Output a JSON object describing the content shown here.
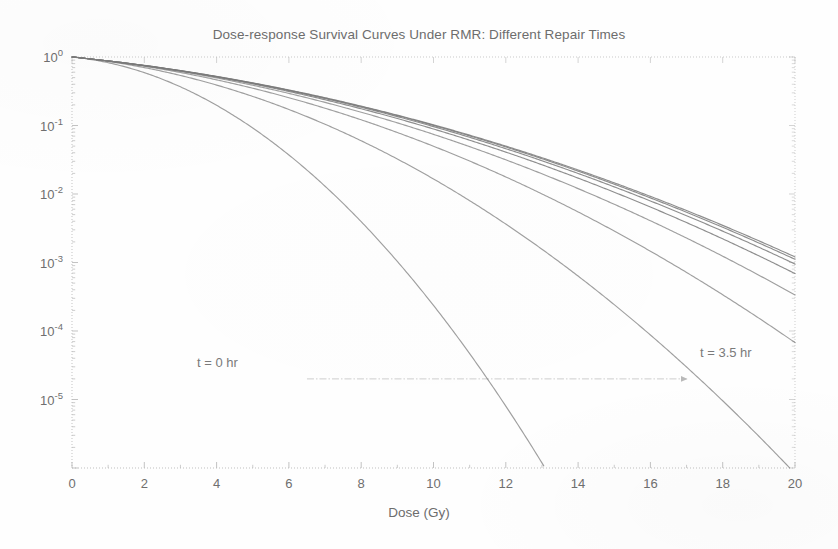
{
  "figure": {
    "title": "Dose-response Survival Curves Under RMR: Different Repair Times",
    "background_color": "#fefefe",
    "axis_color": "#b9b9b9",
    "curve_color": "#7a7a7a",
    "text_color": "#6d6d6d"
  },
  "annotations": {
    "left_label": "t = 0 hr",
    "right_label": "t = 3.5 hr",
    "arrow_icon": "arrow-right-icon"
  },
  "chart_data": {
    "type": "line",
    "title": "Dose-response Survival Curves Under RMR: Different Repair Times",
    "xlabel": "Dose (Gy)",
    "ylabel": "",
    "yscale": "log",
    "xscale": "linear",
    "xlim": [
      0,
      20
    ],
    "ylim": [
      1e-06,
      1
    ],
    "xticks": [
      0,
      2,
      4,
      6,
      8,
      10,
      12,
      14,
      16,
      18,
      20
    ],
    "xticklabels": [
      "0",
      "2",
      "4",
      "6",
      "8",
      "10",
      "12",
      "14",
      "16",
      "18",
      "20"
    ],
    "yticks": [
      1,
      0.1,
      0.01,
      0.001,
      0.0001,
      1e-05
    ],
    "yticklabels": [
      "10^0",
      "10^-1",
      "10^-2",
      "10^-3",
      "10^-4",
      "10^-5"
    ],
    "grid": false,
    "minor_ticks": true,
    "legend": "none",
    "annotations": [
      {
        "text": "t = 0 hr",
        "x": 5.0,
        "y": 3e-05
      },
      {
        "text": "t = 3.5 hr",
        "x": 17.2,
        "y": 5.5e-05
      },
      {
        "text": "arrow",
        "from_x": 6.5,
        "to_x": 17.2,
        "y": 2e-05
      }
    ],
    "model": "linear-quadratic with repair: log10(S) = -(alpha*D + beta_eff*D^2)/ln(10)",
    "series": [
      {
        "name": "t = 0 hr",
        "repair_time_hr": 0.0,
        "alpha": 0.12,
        "beta": 0.0715,
        "x_at_axis_exit": 8.7
      },
      {
        "name": "t = 0.5 hr",
        "repair_time_hr": 0.5,
        "alpha": 0.12,
        "beta": 0.029,
        "x_at_axis_exit": 13.4
      },
      {
        "name": "t = 1.0 hr",
        "repair_time_hr": 1.0,
        "alpha": 0.12,
        "beta": 0.018,
        "x_at_axis_exit": 16.9
      },
      {
        "name": "t = 1.5 hr",
        "repair_time_hr": 1.5,
        "alpha": 0.12,
        "beta": 0.014,
        "x_at_axis_exit": 18.8
      },
      {
        "name": "t = 2.0 hr",
        "repair_time_hr": 2.0,
        "alpha": 0.12,
        "beta": 0.0122,
        "x_at_axis_exit": 19.9
      },
      {
        "name": "t = 2.5 hr",
        "repair_time_hr": 2.5,
        "alpha": 0.12,
        "beta": 0.0114,
        "x_at_axis_exit": 20.0
      },
      {
        "name": "t = 3.0 hr",
        "repair_time_hr": 3.0,
        "alpha": 0.12,
        "beta": 0.011,
        "x_at_axis_exit": 20.0
      },
      {
        "name": "t = 3.5 hr",
        "repair_time_hr": 3.5,
        "alpha": 0.12,
        "beta": 0.0108,
        "x_at_axis_exit": 20.0
      }
    ],
    "sample_points": {
      "x": [
        0,
        2,
        4,
        6,
        8,
        10,
        12,
        14,
        16,
        18,
        20
      ],
      "t0": [
        1,
        0.36,
        0.041,
        0.0016,
        2e-05,
        8.3e-08,
        1.1e-10,
        4.8e-14,
        6.8e-18,
        3.1e-22,
        4.6e-27
      ],
      "t0_5": [
        1,
        0.59,
        0.22,
        0.046,
        0.0055,
        0.00037,
        1.4e-05,
        3e-07,
        3.6e-09,
        2.5e-11,
        9.7e-14
      ],
      "t1": [
        1,
        0.67,
        0.32,
        0.11,
        0.025,
        0.0042,
        0.00049,
        4.2e-05,
        2.5e-06,
        1.1e-07,
        3.4e-09
      ],
      "t1_5": [
        1,
        0.71,
        0.38,
        0.15,
        0.044,
        0.0097,
        0.0016,
        0.0002,
        1.8e-05,
        1.2e-06,
        6.1e-08
      ],
      "t2": [
        1,
        0.72,
        0.4,
        0.17,
        0.055,
        0.014,
        0.0027,
        0.00039,
        4.3e-05,
        3.6e-06,
        2.3e-07
      ],
      "t2_5": [
        1,
        0.73,
        0.41,
        0.18,
        0.061,
        0.016,
        0.0034,
        0.00055,
        6.9e-05,
        6.6e-06,
        4.8e-07
      ],
      "t3": [
        1,
        0.73,
        0.42,
        0.19,
        0.064,
        0.018,
        0.0039,
        0.00066,
        8.9e-05,
        9.3e-06,
        7.4e-07
      ],
      "t3_5": [
        1,
        0.73,
        0.42,
        0.19,
        0.066,
        0.018,
        0.0041,
        0.00073,
        0.0001,
        1.1e-05,
        9.4e-07
      ]
    }
  },
  "axes": {
    "x_tick_labels": [
      "0",
      "2",
      "4",
      "6",
      "8",
      "10",
      "12",
      "14",
      "16",
      "18",
      "20"
    ],
    "y_tick_mantissa": "10",
    "y_tick_exponents": [
      "0",
      "-1",
      "-2",
      "-3",
      "-4",
      "-5"
    ],
    "x_title": "Dose (Gy)"
  }
}
